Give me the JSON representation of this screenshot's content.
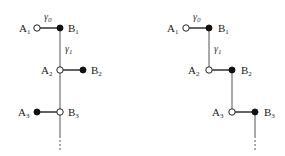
{
  "diagram": {
    "left": {
      "gamma0": "γ0",
      "gamma1": "γ1",
      "nodes": {
        "A1": {
          "label": "A",
          "sub": "1",
          "x": 37,
          "y": 28,
          "type": "open"
        },
        "B1": {
          "label": "B",
          "sub": "1",
          "x": 60,
          "y": 28,
          "type": "filled"
        },
        "A2": {
          "label": "A",
          "sub": "2",
          "x": 60,
          "y": 70,
          "type": "open"
        },
        "B2": {
          "label": "B",
          "sub": "2",
          "x": 83,
          "y": 70,
          "type": "filled"
        },
        "A3": {
          "label": "A",
          "sub": "3",
          "x": 37,
          "y": 112,
          "type": "filled"
        },
        "B3": {
          "label": "B",
          "sub": "3",
          "x": 60,
          "y": 112,
          "type": "open"
        }
      }
    },
    "right": {
      "gamma0": "γ0",
      "gamma1": "γ1",
      "nodes": {
        "A1": {
          "label": "A",
          "sub": "1",
          "x": 186,
          "y": 28,
          "type": "open"
        },
        "B1": {
          "label": "B",
          "sub": "1",
          "x": 209,
          "y": 28,
          "type": "filled"
        },
        "A2": {
          "label": "A",
          "sub": "2",
          "x": 209,
          "y": 70,
          "type": "open"
        },
        "B2": {
          "label": "B",
          "sub": "2",
          "x": 232,
          "y": 70,
          "type": "filled"
        },
        "A3": {
          "label": "A",
          "sub": "3",
          "x": 232,
          "y": 112,
          "type": "open"
        },
        "B3": {
          "label": "B",
          "sub": "3",
          "x": 255,
          "y": 112,
          "type": "filled"
        }
      }
    },
    "labels": {
      "A": "A",
      "B": "B",
      "s1": "1",
      "s2": "2",
      "s3": "3",
      "gamma": "γ",
      "g0": "0",
      "g1": "1"
    }
  }
}
